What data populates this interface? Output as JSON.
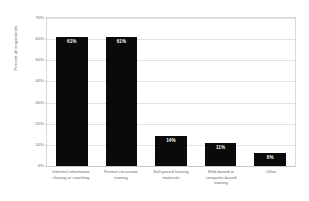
{
  "chart_data": {
    "type": "bar",
    "title": "",
    "subtitle": "",
    "xlabel": "",
    "ylabel": "Percent of respondents",
    "ylim": [
      0,
      70
    ],
    "ytick_labels": [
      "0%",
      "10%",
      "20%",
      "30%",
      "40%",
      "50%",
      "60%",
      "70%"
    ],
    "ytick_values": [
      0,
      10,
      20,
      30,
      40,
      50,
      60,
      70
    ],
    "grid": true,
    "legend": "none",
    "orientation": "vertical",
    "bar_color": "#0a0a0a",
    "categories": [
      "Informal information sharing or coaching",
      "Formal classroom training",
      "Self-paced training materials",
      "Web-based or computer-based training",
      "Other"
    ],
    "category_lines": [
      [
        "Informal information",
        "sharing or coaching"
      ],
      [
        "Formal classroom",
        "training"
      ],
      [
        "Self-paced training",
        "materials"
      ],
      [
        "Web-based or",
        "computer-based",
        "training"
      ],
      [
        "Other"
      ]
    ],
    "values": [
      61,
      61,
      14,
      11,
      6
    ],
    "value_labels": [
      "61%",
      "61%",
      "14%",
      "11%",
      "6%"
    ]
  },
  "style": {
    "background": "#ffffff",
    "grid_color": "#e2e2e2",
    "frame_color": "#d9d9d9",
    "text_color": "#6b6b6b",
    "value_label_color": "#ffffff"
  }
}
